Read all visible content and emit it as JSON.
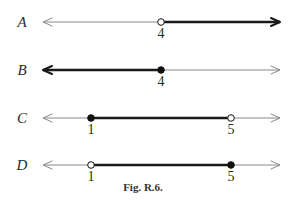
{
  "figure": {
    "caption": "Fig. R.6.",
    "line_x_start": 43,
    "line_x_end": 280,
    "colors": {
      "thin_line": "#8a8a8a",
      "bold_line": "#1a1a1a",
      "point_fill": "#111111",
      "open_fill": "#ffffff"
    }
  },
  "rows": [
    {
      "label": "A",
      "y": 22,
      "points": [
        {
          "value": "4",
          "x": 161,
          "type": "open"
        }
      ],
      "bold_segment": {
        "from": 161,
        "to": 280
      },
      "bold_arrow_right": true,
      "bold_arrow_left": false
    },
    {
      "label": "B",
      "y": 70,
      "points": [
        {
          "value": "4",
          "x": 161,
          "type": "closed"
        }
      ],
      "bold_segment": {
        "from": 43,
        "to": 161
      },
      "bold_arrow_right": false,
      "bold_arrow_left": true
    },
    {
      "label": "C",
      "y": 118,
      "points": [
        {
          "value": "1",
          "x": 91,
          "type": "closed"
        },
        {
          "value": "5",
          "x": 231,
          "type": "open"
        }
      ],
      "bold_segment": {
        "from": 91,
        "to": 231
      },
      "bold_arrow_right": false,
      "bold_arrow_left": false
    },
    {
      "label": "D",
      "y": 165,
      "points": [
        {
          "value": "1",
          "x": 91,
          "type": "open"
        },
        {
          "value": "5",
          "x": 231,
          "type": "closed"
        }
      ],
      "bold_segment": {
        "from": 91,
        "to": 231
      },
      "bold_arrow_right": false,
      "bold_arrow_left": false
    }
  ]
}
